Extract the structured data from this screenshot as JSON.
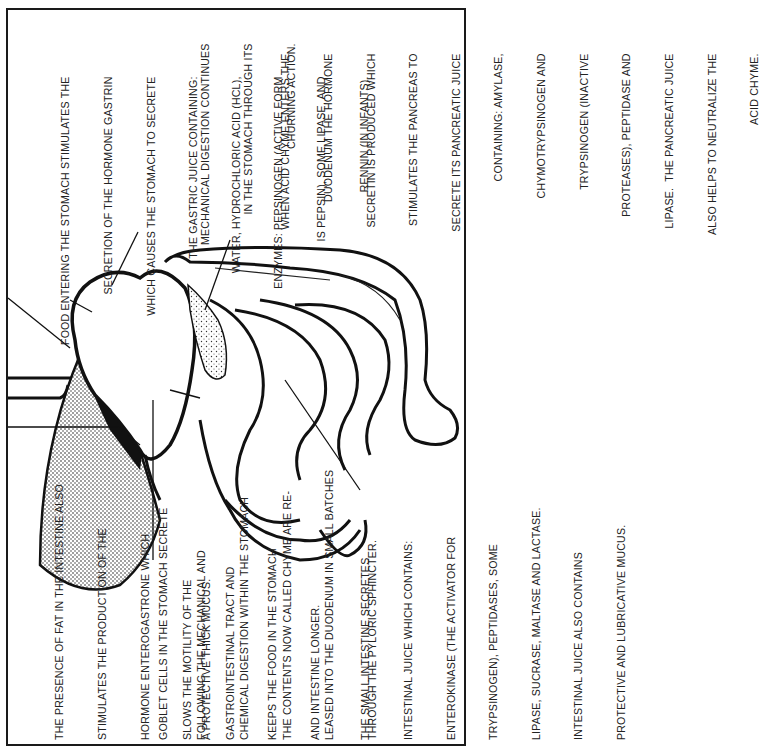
{
  "figure": {
    "orientation": "rotated-90-ccw",
    "colors": {
      "ink": "#1a1a1a",
      "paper": "#ffffff",
      "stipple": "#555555"
    }
  },
  "labels": {
    "food_entering": {
      "lines": [
        "FOOD ENTERING THE STOMACH STIMULATES THE",
        "SECRETION OF THE HORMONE GASTRIN",
        "WHICH CAUSES THE STOMACH TO SECRETE",
        "THE GASTRIC JUICE CONTAINING:",
        "WATER, HYDROCHLORIC ACID (HCl),",
        "ENZYMES: PEPSINOGEN (ACTIVE FORM",
        "IS PEPSIN), SOME LIPASE, AND",
        "RENNIN (IN INFANTS)."
      ]
    },
    "mechanical_digestion": {
      "lines": [
        "MECHANICAL DIGESTION CONTINUES",
        "IN THE STOMACH THROUGH ITS",
        "CHURNING ACTION."
      ]
    },
    "acid_chyme": {
      "lines": [
        "WHEN ACID CHYME ENTERS THE",
        "DUODENUM THE HORMONE",
        "SECRETIN IS PRODUCED WHICH",
        "STIMULATES THE PANCREAS TO",
        "SECRETE ITS PANCREATIC JUICE",
        "CONTAINING: AMYLASE,",
        "CHYMOTRYPSINOGEN AND",
        "TRYPSINOGEN (INACTIVE",
        "PROTEASES), PEPTIDASE AND",
        "LIPASE.  THE PANCREATIC JUICE",
        "ALSO HELPS TO NEUTRALIZE THE",
        "ACID CHYME."
      ]
    },
    "fat_presence": {
      "lines": [
        "THE PRESENCE OF FAT IN THE INTESTINE ALSO",
        "STIMULATES THE PRODUCTION OF THE",
        "HORMONE ENTEROGASTRONE WHICH",
        "SLOWS THE MOTILITY OF THE",
        "GASTROINTESTINAL TRACT AND",
        "KEEPS THE FOOD IN THE STOMACH",
        "AND INTESTINE LONGER."
      ]
    },
    "goblet_cells": {
      "lines": [
        "GOBLET CELLS IN THE STOMACH SECRETE",
        "A PROTECTIVE THICK MUCUS."
      ]
    },
    "following_digestion": {
      "lines": [
        "FOLLOWING THE MECHANICAL AND",
        "CHEMICAL DIGESTION WITHIN THE STOMACH",
        "THE CONTENTS NOW CALLED CHYME ARE RE-",
        "LEASED INTO THE DUODENUM IN SMALL BATCHES",
        "THROUGH THE PYLORIC SPHINCTER."
      ]
    },
    "small_intestine": {
      "lines": [
        "THE SMALL INTESTINE SECRETES",
        "INTESTINAL JUICE WHICH CONTAINS:",
        "ENTEROKINASE (THE ACTIVATOR FOR",
        "TRYPSINOGEN), PEPTIDASES, SOME",
        "LIPASE, SUCRASE, MALTASE AND LACTASE.",
        "INTESTINAL JUICE ALSO CONTAINS",
        "PROTECTIVE AND LUBRICATIVE MUCUS."
      ]
    }
  }
}
